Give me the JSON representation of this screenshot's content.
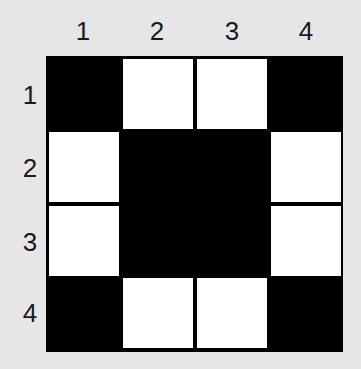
{
  "grid": {
    "rows": 4,
    "cols": 4,
    "column_labels": [
      "1",
      "2",
      "3",
      "4"
    ],
    "row_labels": [
      "1",
      "2",
      "3",
      "4"
    ],
    "cells": [
      [
        "black",
        "white",
        "white",
        "black"
      ],
      [
        "white",
        "black",
        "black",
        "white"
      ],
      [
        "white",
        "black",
        "black",
        "white"
      ],
      [
        "black",
        "white",
        "white",
        "black"
      ]
    ],
    "colors": {
      "black": "#000000",
      "white": "#ffffff",
      "background": "#e6e6e6"
    }
  }
}
